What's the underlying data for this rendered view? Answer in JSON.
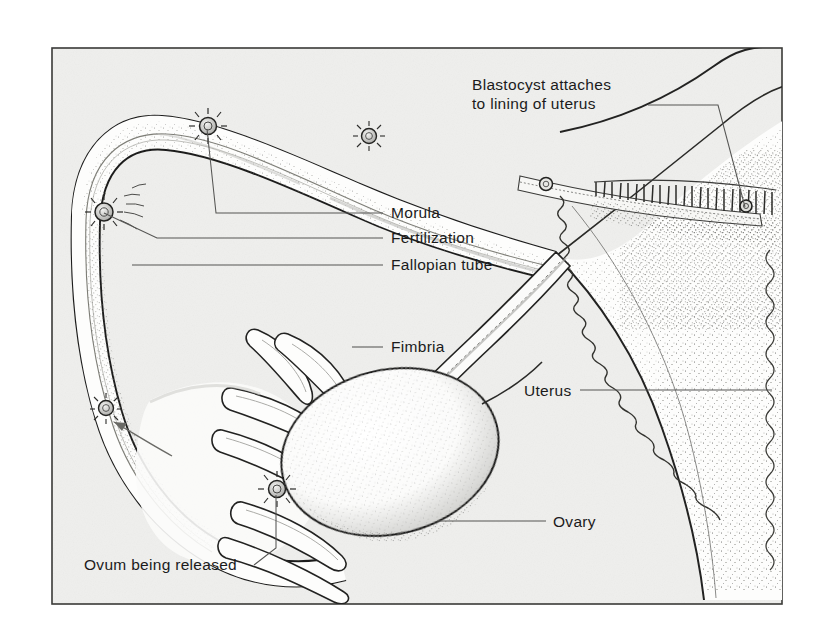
{
  "figure": {
    "medium": "scanned line-and-stipple textbook illustration",
    "frame": {
      "x": 52,
      "y": 48,
      "width": 730,
      "height": 556,
      "border_color": "#3a3a38"
    },
    "colors": {
      "paper": "#efefed",
      "page_white": "#ffffff",
      "ink": "#1b1b1b",
      "ink_light": "#6e6e6c",
      "tissue_fill": "#fbfbfa",
      "stipple": "#8a8a88",
      "leader_line": "#555553"
    },
    "labels": [
      {
        "id": "blastocyst",
        "text_lines": [
          "Blastocyst attaches",
          "to lining of uterus"
        ],
        "text_x": 472,
        "text_y": 90,
        "anchor": "start",
        "leader": "M 648 105 L 718 105 L 745 207"
      },
      {
        "id": "morula",
        "text_lines": [
          "Morula"
        ],
        "text_x": 391,
        "text_y": 218,
        "anchor": "start",
        "leader": "M 383 213 L 216 213 L 207 129"
      },
      {
        "id": "fertilization",
        "text_lines": [
          "Fertilization"
        ],
        "text_x": 391,
        "text_y": 243,
        "anchor": "start",
        "leader": "M 383 238 L 157 238 L 104 213"
      },
      {
        "id": "fallopian-tube",
        "text_lines": [
          "Fallopian tube"
        ],
        "text_x": 391,
        "text_y": 270,
        "anchor": "start",
        "leader": "M 383 265 L 132 265"
      },
      {
        "id": "fimbria",
        "text_lines": [
          "Fimbria"
        ],
        "text_x": 391,
        "text_y": 352,
        "anchor": "start",
        "leader": "M 383 347 L 352 347"
      },
      {
        "id": "uterus",
        "text_lines": [
          "Uterus"
        ],
        "text_x": 524,
        "text_y": 396,
        "anchor": "start",
        "leader": "M 580 390 L 772 390"
      },
      {
        "id": "ovary",
        "text_lines": [
          "Ovary"
        ],
        "text_x": 553,
        "text_y": 527,
        "anchor": "start",
        "leader": "M 546 521 L 437 521"
      },
      {
        "id": "ovum-being-released",
        "text_lines": [
          "Ovum being released"
        ],
        "text_x": 84,
        "text_y": 570,
        "anchor": "start",
        "leader": "M 254 565 L 276 548 L 276 495"
      }
    ],
    "ova": [
      {
        "id": "ovum-at-ovary",
        "cx": 277,
        "cy": 489,
        "r": 8.5,
        "stage": "ovum being released"
      },
      {
        "id": "ovum-in-ampulla",
        "cx": 104,
        "cy": 212,
        "r": 9.0,
        "stage": "fertilization"
      },
      {
        "id": "ovum-travelling",
        "cx": 106,
        "cy": 408,
        "r": 7.5,
        "stage": "captured by fimbria"
      },
      {
        "id": "ovum-morula",
        "cx": 208,
        "cy": 126,
        "r": 8.5,
        "stage": "morula"
      },
      {
        "id": "ovum-late-morula",
        "cx": 369,
        "cy": 136,
        "r": 7.5,
        "stage": "dividing"
      },
      {
        "id": "ovum-blastocyst",
        "cx": 546,
        "cy": 184,
        "r": 6.5,
        "stage": "blastocyst"
      },
      {
        "id": "ovum-implanting",
        "cx": 746,
        "cy": 206,
        "r": 6.0,
        "stage": "implanted"
      }
    ],
    "structures": [
      {
        "id": "fallopian-tube",
        "name": "Fallopian tube"
      },
      {
        "id": "ovary",
        "name": "Ovary"
      },
      {
        "id": "fimbriae",
        "name": "Fimbria",
        "count": 6
      },
      {
        "id": "uterus-body",
        "name": "Uterus"
      },
      {
        "id": "uterine-lining",
        "name": "Lining of uterus"
      }
    ],
    "flow_arrow": {
      "id": "travel-direction-arrow",
      "from": [
        168,
        452
      ],
      "to": [
        112,
        421
      ]
    }
  }
}
